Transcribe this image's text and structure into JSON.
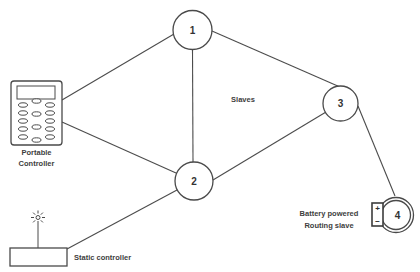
{
  "nodes": [
    {
      "id": "node-1",
      "label": "1"
    },
    {
      "id": "node-2",
      "label": "2"
    },
    {
      "id": "node-3",
      "label": "3"
    },
    {
      "id": "node-4",
      "label": "4"
    }
  ],
  "labels": {
    "slaves": "Slaves",
    "portable_controller_line1": "Portable",
    "portable_controller_line2": "Controller",
    "static_controller": "Static controller",
    "battery_line1": "Battery powered",
    "battery_line2": "Routing slave",
    "battery_positive": "+",
    "battery_negative": "−"
  },
  "edges": [
    {
      "from": "portable-controller",
      "to": "node-1"
    },
    {
      "from": "portable-controller",
      "to": "node-2"
    },
    {
      "from": "node-1",
      "to": "node-2"
    },
    {
      "from": "node-1",
      "to": "node-3"
    },
    {
      "from": "node-2",
      "to": "node-3"
    },
    {
      "from": "node-2",
      "to": "static-controller"
    },
    {
      "from": "node-3",
      "to": "node-4"
    }
  ],
  "colors": {
    "stroke": "#4a4a4a",
    "text": "#3d3d3d",
    "background": "#ffffff"
  }
}
